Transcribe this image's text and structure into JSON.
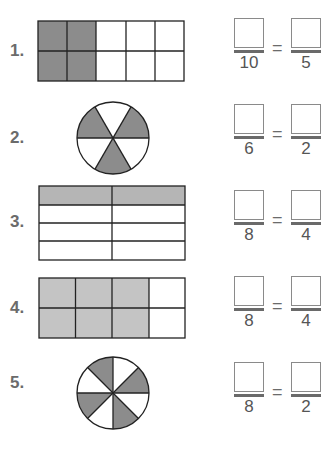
{
  "colors": {
    "shade": "#8c8c8c",
    "light_shade": "#bdbdbd",
    "line": "#222222"
  },
  "problems": [
    {
      "label": "1.",
      "figure": "grid 2x5, 4 shaded",
      "left_denominator": "10",
      "equals": "=",
      "right_denominator": "5"
    },
    {
      "label": "2.",
      "figure": "circle 6 slices, 3 shaded",
      "left_denominator": "6",
      "equals": "=",
      "right_denominator": "2"
    },
    {
      "label": "3.",
      "figure": "table 4x2, top row shaded",
      "left_denominator": "8",
      "equals": "=",
      "right_denominator": "4"
    },
    {
      "label": "4.",
      "figure": "grid 2x4, 6 shaded",
      "left_denominator": "8",
      "equals": "=",
      "right_denominator": "4"
    },
    {
      "label": "5.",
      "figure": "circle 8 slices, 4 shaded",
      "left_denominator": "8",
      "equals": "=",
      "right_denominator": "2"
    }
  ]
}
